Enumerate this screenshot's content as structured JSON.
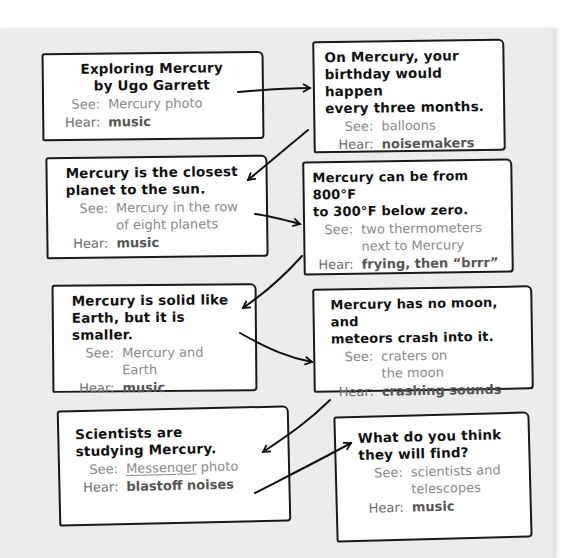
{
  "document": {
    "labels": {
      "see": "See:",
      "hear": "Hear:"
    },
    "cards": [
      {
        "fact": "Exploring Mercury\nby Ugo Garrett",
        "see": "Mercury photo",
        "hear": "music"
      },
      {
        "fact": "On Mercury, your\nbirthday would happen\nevery three months.",
        "see": "balloons",
        "hear": "noisemakers"
      },
      {
        "fact": "Mercury is the closest\nplanet to the sun.",
        "see": "Mercury in the row\nof eight planets",
        "hear": "music"
      },
      {
        "fact": "Mercury can be from 800°F\nto 300°F below zero.",
        "see": "two thermometers\nnext to Mercury",
        "hear": "frying, then “brrr”"
      },
      {
        "fact": "Mercury is solid like\nEarth, but it is smaller.",
        "see": "Mercury and\nEarth",
        "hear": "music"
      },
      {
        "fact": "Mercury has no moon, and\nmeteors crash into it.",
        "see": "craters on\nthe moon",
        "hear": "crashing sounds"
      },
      {
        "fact": "Scientists are\nstudying Mercury.",
        "see_underlined": "Messenger",
        "see": " photo",
        "hear": "blastoff noises"
      },
      {
        "fact": "What do you think\nthey will find?",
        "see": "scientists and\ntelescopes",
        "hear": "music"
      }
    ],
    "colors": {
      "paper": "#ececec",
      "card": "#ffffff",
      "ink": "#111111",
      "see_text": "#8a8a8a",
      "hear_text": "#555555"
    }
  }
}
